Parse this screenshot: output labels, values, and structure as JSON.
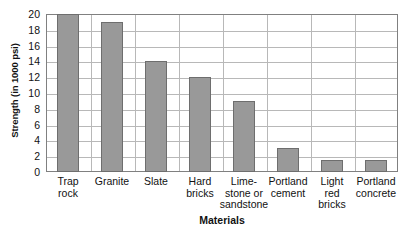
{
  "chart_data": {
    "type": "bar",
    "title": "",
    "xlabel": "Materials",
    "ylabel": "Strength (in 1000 psi)",
    "ylim": [
      0,
      20
    ],
    "yticks": [
      0,
      2,
      4,
      6,
      8,
      10,
      12,
      14,
      16,
      18,
      20
    ],
    "grid": "horizontal-and-vertical",
    "legend": "none",
    "bar_color": "#999999",
    "bar_border_color": "#6e6e6e",
    "grid_color": "#b8b8b8",
    "axis_color": "#808080",
    "categories": [
      "Trap rock",
      "Granite",
      "Slate",
      "Hard bricks",
      "Lime- stone or sandstone",
      "Portland cement",
      "Light red bricks",
      "Portland concrete"
    ],
    "category_lines": [
      [
        "Trap",
        "rock"
      ],
      [
        "Granite"
      ],
      [
        "Slate"
      ],
      [
        "Hard",
        "bricks"
      ],
      [
        "Lime-",
        "stone or",
        "sandstone"
      ],
      [
        "Portland",
        "cement"
      ],
      [
        "Light",
        "red",
        "bricks"
      ],
      [
        "Portland",
        "concrete"
      ]
    ],
    "values": [
      20,
      19,
      14,
      12,
      9,
      3,
      1.5,
      1.5
    ]
  }
}
